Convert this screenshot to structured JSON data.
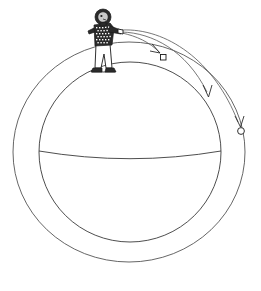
{
  "figure": {
    "title": "Newton's cannonball",
    "description": "A person standing on top of a large sphere throws projectiles horizontally; three trajectories of increasing range curve around the sphere, the longest reaching the outer ring.",
    "background_color": "#ffffff",
    "line_color": "#3a3a3a",
    "ink_color": "#1a1a1a"
  },
  "sphere": {
    "name": "planet-sphere",
    "center_x": 130,
    "center_y": 152,
    "radius": 91,
    "equator_label": "equator",
    "equator_y": 152,
    "equator_sag": 6
  },
  "outer_ring": {
    "name": "orbit-ring",
    "center_x": 129,
    "center_y": 152,
    "radius": 116
  },
  "person": {
    "name": "thrower",
    "stand_x": 104,
    "stand_y": 62,
    "head_fill": "#2b2b2b",
    "shirt_pattern": "checkered",
    "shirt_fill": "#2b2b2b",
    "pants_fill": "#ffffff"
  },
  "trajectories": [
    {
      "name": "trajectory-short",
      "label": "shortest throw",
      "path": "M 122 33 C 136 36 150 42 160 53",
      "landing_marker": "square",
      "landing_x": 163,
      "landing_y": 57,
      "arrow_angle": 52
    },
    {
      "name": "trajectory-medium",
      "label": "medium throw",
      "path": "M 122 32 C 152 33 186 50 207 92",
      "landing_marker": "arrow",
      "landing_x": 209,
      "landing_y": 98,
      "arrow_angle": 72
    },
    {
      "name": "trajectory-long",
      "label": "longest throw reaching outer ring",
      "path": "M 122 30 C 166 28 214 60 238 122",
      "landing_marker": "circle",
      "landing_x": 241,
      "landing_y": 131,
      "arrow_angle": 78
    }
  ],
  "markers": [
    {
      "name": "landing-marker-square",
      "shape": "square",
      "x": 163,
      "y": 57,
      "size": 5
    },
    {
      "name": "landing-marker-arrow",
      "shape": "arrow",
      "x": 209,
      "y": 99,
      "size": 5
    },
    {
      "name": "landing-marker-circle",
      "shape": "circle",
      "x": 241,
      "y": 131,
      "size": 4
    }
  ]
}
